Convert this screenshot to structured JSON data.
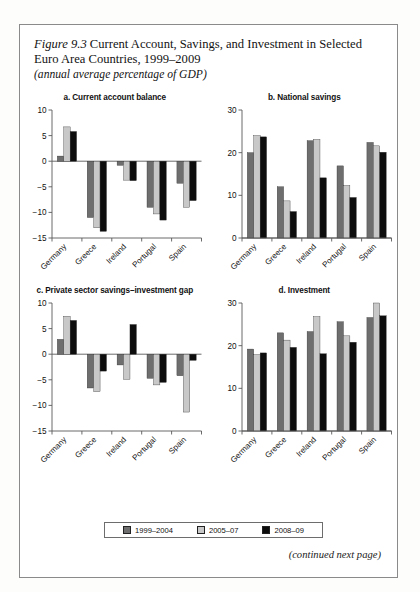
{
  "figure": {
    "number": "Figure 9.3",
    "title": "Current Account, Savings, and Investment in Selected Euro Area Countries, 1999–2009",
    "subtitle": "(annual average percentage of GDP)",
    "continued_note": "(continued next page)"
  },
  "legend": {
    "items": [
      {
        "label": "1999–2004",
        "color": "#6e6e6e"
      },
      {
        "label": "2005–07",
        "color": "#c8c8c8"
      },
      {
        "label": "2008–09",
        "color": "#0d0d0d"
      }
    ]
  },
  "colors": {
    "series1": "#6e6e6e",
    "series2": "#c8c8c8",
    "series3": "#0d0d0d",
    "axis": "#5a5a5a",
    "text": "#111111"
  },
  "chart_data": [
    {
      "type": "bar",
      "panel": "a",
      "title": "a. Current account balance",
      "categories": [
        "Germany",
        "Greece",
        "Ireland",
        "Portugal",
        "Spain"
      ],
      "series": [
        {
          "name": "1999–2004",
          "values": [
            1.0,
            -11.0,
            -0.8,
            -9.0,
            -4.3
          ]
        },
        {
          "name": "2005–07",
          "values": [
            6.7,
            -13.0,
            -3.7,
            -10.3,
            -9.0
          ]
        },
        {
          "name": "2008–09",
          "values": [
            5.8,
            -13.7,
            -3.8,
            -11.5,
            -7.7
          ]
        }
      ],
      "xlabel": "",
      "ylabel": "",
      "ylim": [
        -15,
        10
      ],
      "yticks": [
        10,
        5,
        0,
        -5,
        -10,
        -15
      ],
      "ytick_labels": [
        "10",
        "5",
        "0",
        "−5",
        "−10",
        "−15"
      ],
      "grid": false
    },
    {
      "type": "bar",
      "panel": "b",
      "title": "b. National savings",
      "categories": [
        "Germany",
        "Greece",
        "Ireland",
        "Portugal",
        "Spain"
      ],
      "series": [
        {
          "name": "1999–2004",
          "values": [
            20.0,
            12.0,
            22.8,
            16.9,
            22.4
          ]
        },
        {
          "name": "2005–07",
          "values": [
            24.0,
            8.7,
            23.1,
            12.3,
            21.6
          ]
        },
        {
          "name": "2008–09",
          "values": [
            23.7,
            6.2,
            14.1,
            9.5,
            20.1
          ]
        }
      ],
      "xlabel": "",
      "ylabel": "",
      "ylim": [
        0,
        30
      ],
      "yticks": [
        30,
        20,
        10,
        0
      ],
      "ytick_labels": [
        "30",
        "20",
        "10",
        "0"
      ],
      "grid": false
    },
    {
      "type": "bar",
      "panel": "c",
      "title": "c. Private sector savings–investment gap",
      "categories": [
        "Germany",
        "Greece",
        "Ireland",
        "Portugal",
        "Spain"
      ],
      "series": [
        {
          "name": "1999–2004",
          "values": [
            2.9,
            -6.6,
            -2.1,
            -4.7,
            -4.2
          ]
        },
        {
          "name": "2005–07",
          "values": [
            7.4,
            -7.3,
            -4.9,
            -6.0,
            -11.3
          ]
        },
        {
          "name": "2008–09",
          "values": [
            6.6,
            -3.3,
            5.8,
            -5.5,
            -1.2
          ]
        }
      ],
      "xlabel": "",
      "ylabel": "",
      "ylim": [
        -15,
        10
      ],
      "yticks": [
        10,
        5,
        0,
        -5,
        -10,
        -15
      ],
      "ytick_labels": [
        "10",
        "5",
        "0",
        "−5",
        "−10",
        "−15"
      ],
      "grid": false
    },
    {
      "type": "bar",
      "panel": "d",
      "title": "d. Investment",
      "categories": [
        "Germany",
        "Greece",
        "Ireland",
        "Portugal",
        "Spain"
      ],
      "series": [
        {
          "name": "1999–2004",
          "values": [
            19.2,
            23.0,
            23.3,
            25.6,
            26.6
          ]
        },
        {
          "name": "2005–07",
          "values": [
            17.9,
            21.3,
            26.8,
            22.3,
            30.0
          ]
        },
        {
          "name": "2008–09",
          "values": [
            18.3,
            19.6,
            18.1,
            20.8,
            27.0
          ]
        }
      ],
      "xlabel": "",
      "ylabel": "",
      "ylim": [
        0,
        30
      ],
      "yticks": [
        30,
        20,
        10,
        0
      ],
      "ytick_labels": [
        "30",
        "20",
        "10",
        "0"
      ],
      "grid": false
    }
  ]
}
